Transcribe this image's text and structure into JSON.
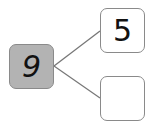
{
  "diagram": {
    "type": "number-bond",
    "whole": {
      "value": "9",
      "fill": "#b3b3b3"
    },
    "parts": [
      {
        "value": "5"
      },
      {
        "value": ""
      }
    ],
    "line_color": "#777777"
  }
}
